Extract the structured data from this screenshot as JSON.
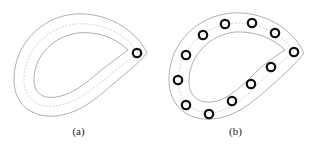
{
  "figure": {
    "panels": [
      {
        "id": "a",
        "caption": "(a)",
        "circle_count": 1,
        "circles": [
          [
            137,
            53
          ]
        ]
      },
      {
        "id": "b",
        "caption": "(b)",
        "circle_count": 12,
        "circles": [
          [
            225,
            24
          ],
          [
            252,
            23
          ],
          [
            275,
            33
          ],
          [
            203,
            35
          ],
          [
            186,
            55
          ],
          [
            178,
            80
          ],
          [
            186,
            105
          ],
          [
            209,
            114
          ],
          [
            232,
            101
          ],
          [
            251,
            84
          ],
          [
            271,
            67
          ],
          [
            294,
            52
          ]
        ]
      }
    ],
    "colors": {
      "outline": "#9a9a9a",
      "centerline": "#b5b5b5",
      "marker": "#111111",
      "background": "#ffffff"
    }
  }
}
